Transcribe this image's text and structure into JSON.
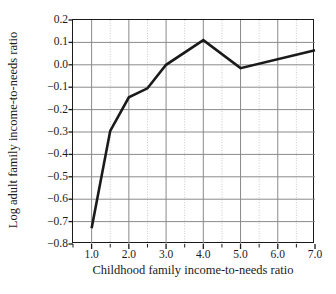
{
  "figure": {
    "background_color": "#ffffff",
    "line_color": "#1a1a1a",
    "grid_major_color": "#8a8a8a",
    "grid_minor_color": "#c9c9c9"
  },
  "chart_data": {
    "type": "line",
    "title": "",
    "xlabel": "Childhood family income-to-needs ratio",
    "ylabel": "Log adult family income-to-needs ratio",
    "xlim": [
      0.5,
      7.0
    ],
    "ylim": [
      -0.8,
      0.2
    ],
    "grid": true,
    "grid_major_x": [
      1.0,
      2.0,
      3.0,
      4.0,
      5.0,
      6.0,
      7.0
    ],
    "grid_minor_x": [
      1.5,
      2.5,
      3.5,
      4.5,
      5.5,
      6.5
    ],
    "grid_major_y": [
      -0.8,
      -0.7,
      -0.6,
      -0.5,
      -0.4,
      -0.3,
      -0.2,
      -0.1,
      0.0,
      0.1,
      0.2
    ],
    "legend": "none",
    "xticks": [
      1.0,
      2.0,
      3.0,
      4.0,
      5.0,
      6.0,
      7.0
    ],
    "xticklabels": [
      "1.0",
      "2.0",
      "3.0",
      "4.0",
      "5.0",
      "6.0",
      "7.0"
    ],
    "xticks_minor": [
      0.5,
      1.5,
      2.5,
      3.5,
      4.5,
      5.5,
      6.5
    ],
    "yticks": [
      0.2,
      0.1,
      0.0,
      -0.1,
      -0.2,
      -0.3,
      -0.4,
      -0.5,
      -0.6,
      -0.7,
      -0.8
    ],
    "yticklabels": [
      "0.2",
      "0.1",
      "0.0",
      "−0.1",
      "−0.2",
      "−0.3",
      "−0.4",
      "−0.5",
      "−0.6",
      "−0.7",
      "−0.8"
    ],
    "series": [
      {
        "name": "Log adult family income-to-needs ratio",
        "x": [
          1.0,
          1.5,
          2.0,
          2.5,
          3.0,
          4.0,
          5.0,
          7.0
        ],
        "values": [
          -0.73,
          -0.295,
          -0.145,
          -0.105,
          0.0,
          0.11,
          -0.015,
          0.065
        ]
      }
    ]
  }
}
